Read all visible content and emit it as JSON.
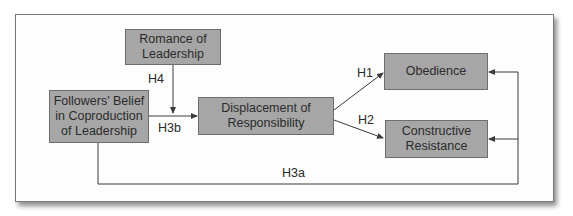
{
  "diagram": {
    "nodes": {
      "romance": "Romance of Leadership",
      "followers": "Followers' Belief in Coproduction of Leadership",
      "displacement": "Displacement of Responsibility",
      "obedience": "Obedience",
      "constructive": "Constructive Resistance"
    },
    "node_lines": {
      "romance": [
        "Romance of",
        "Leadership"
      ],
      "followers": [
        "Followers' Belief",
        "in Coproduction",
        "of Leadership"
      ],
      "displacement": [
        "Displacement of",
        "Responsibility"
      ],
      "obedience": [
        "Obedience"
      ],
      "constructive": [
        "Constructive",
        "Resistance"
      ]
    },
    "edges": [
      {
        "label": "H4",
        "from": "Romance of Leadership",
        "to": "H3b path (moderator)"
      },
      {
        "label": "H3b",
        "from": "Followers' Belief in Coproduction of Leadership",
        "to": "Displacement of Responsibility"
      },
      {
        "label": "H1",
        "from": "Displacement of Responsibility",
        "to": "Obedience"
      },
      {
        "label": "H2",
        "from": "Displacement of Responsibility",
        "to": "Constructive Resistance"
      },
      {
        "label": "H3a",
        "from": "Followers' Belief in Coproduction of Leadership",
        "to": "Obedience; Constructive Resistance"
      }
    ],
    "labels": {
      "h1": "H1",
      "h2": "H2",
      "h3a": "H3a",
      "h3b": "H3b",
      "h4": "H4"
    },
    "colors": {
      "node_fill": "#a6a6a6",
      "node_border": "#6e6e6e",
      "line": "#3a3a3a",
      "text": "#2b2b2b"
    }
  }
}
